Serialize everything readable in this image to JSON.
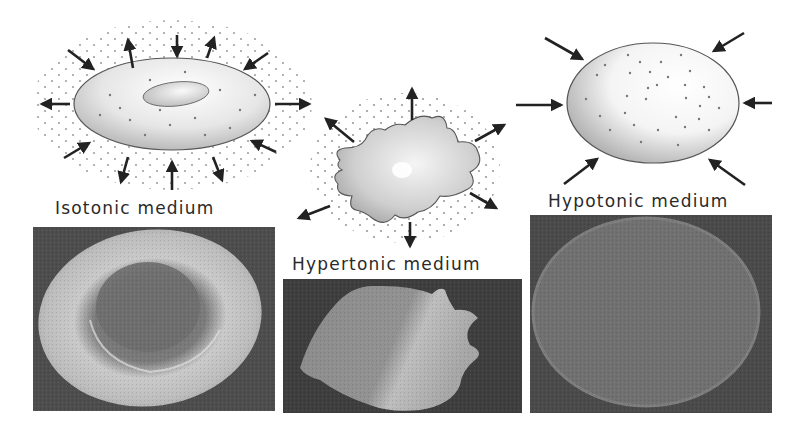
{
  "figure": {
    "panels": [
      {
        "id": "isotonic",
        "label": "Isotonic medium",
        "cell_shape": "biconcave-disc",
        "water_flow": "balanced (arrows in and out)",
        "photo": "scanning-electron-micrograph-normal-rbc"
      },
      {
        "id": "hypertonic",
        "label": "Hypertonic medium",
        "cell_shape": "crenated / shrunken",
        "water_flow": "outward (arrows out)",
        "photo": "scanning-electron-micrograph-crenated-rbc"
      },
      {
        "id": "hypotonic",
        "label": "Hypotonic medium",
        "cell_shape": "swollen sphere",
        "water_flow": "inward (arrows in)",
        "photo": "scanning-electron-micrograph-swollen-rbc"
      }
    ]
  },
  "colors": {
    "background": "#ffffff",
    "arrow": "#222222",
    "cell_outline": "#555555",
    "dot": "#777777",
    "label_text": "#2a2a2a",
    "photo_bg": "#4a4a4a"
  }
}
